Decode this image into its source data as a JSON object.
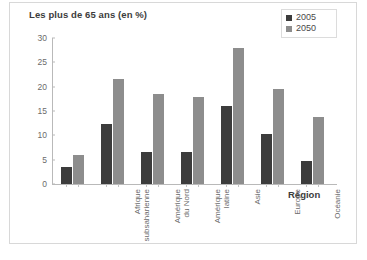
{
  "chart_data": {
    "type": "bar",
    "title": "Les plus de 65 ans (en %)",
    "xlabel": "Région",
    "ylabel": "",
    "ylim": [
      0,
      30
    ],
    "yticks": [
      0,
      5,
      10,
      15,
      20,
      25,
      30
    ],
    "grid": false,
    "legend_position": "top-right",
    "categories": [
      "Afrique\nsubsaharienne",
      "Amérique\ndu Nord",
      "Amérique\nlatine",
      "Asie",
      "Europe",
      "Océanie",
      "Moyen-Orient\net Afrique\ndu Nord"
    ],
    "series": [
      {
        "name": "2005",
        "color": "#3c3c3c",
        "values": [
          3.5,
          12.3,
          6.5,
          6.5,
          16.0,
          10.3,
          4.8
        ]
      },
      {
        "name": "2050",
        "color": "#8d8d8d",
        "values": [
          6.0,
          21.5,
          18.5,
          17.8,
          28.0,
          19.5,
          13.8
        ]
      }
    ]
  },
  "legend": {
    "items": [
      {
        "label": "2005",
        "color": "#3c3c3c"
      },
      {
        "label": "2050",
        "color": "#8d8d8d"
      }
    ]
  }
}
